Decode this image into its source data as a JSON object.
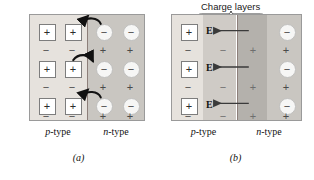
{
  "figure": {
    "title": "",
    "colors": {
      "p_region": "#e6e2dd",
      "n_region": "#c9c6c1",
      "charge_layer_p": "#cfcbc6",
      "charge_layer_n": "#b4b1ac",
      "junction_line": "#8d7f7a",
      "border": "#9a9a9a",
      "arrow": "#111111",
      "text": "#111111"
    }
  },
  "panel_a": {
    "caption": "(a)",
    "left_region_label_prefix": "p",
    "left_region_label_suffix": "-type",
    "right_region_label_prefix": "n",
    "right_region_label_suffix": "-type",
    "p_side_symbols": [
      "+",
      "+",
      "+",
      "+",
      "+",
      "+"
    ],
    "p_free_symbols": [
      "−",
      "−",
      "−",
      "−",
      "−",
      "−"
    ],
    "n_side_symbols": [
      "−",
      "−",
      "−",
      "−",
      "−",
      "−"
    ],
    "n_free_symbols": [
      "+",
      "+",
      "+",
      "+",
      "+",
      "+"
    ],
    "diffusion_arrows": [
      {
        "direction": "left"
      },
      {
        "direction": "right"
      },
      {
        "direction": "left"
      }
    ]
  },
  "panel_b": {
    "caption": "(b)",
    "charge_layers_label": "Charge layers",
    "left_region_label_prefix": "p",
    "left_region_label_suffix": "-type",
    "right_region_label_prefix": "n",
    "right_region_label_suffix": "-type",
    "p_side_symbols": [
      "+",
      "+",
      "+"
    ],
    "p_free_symbols": [
      "−",
      "−",
      "−"
    ],
    "charge_layer_p_symbols": [
      "−",
      "−",
      "−"
    ],
    "charge_layer_n_symbols": [
      "+",
      "+",
      "+"
    ],
    "n_side_symbols": [
      "−",
      "−",
      "−"
    ],
    "n_free_symbols": [
      "+",
      "+",
      "+"
    ],
    "field_labels": [
      "E",
      "E",
      "E"
    ],
    "field_arrow_direction": "left"
  }
}
